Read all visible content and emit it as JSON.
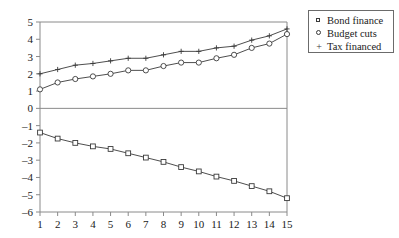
{
  "chart_data": {
    "type": "line",
    "title": "",
    "subtitle": "",
    "xlabel": "",
    "ylabel": "",
    "x": [
      1,
      2,
      3,
      4,
      5,
      6,
      7,
      8,
      9,
      10,
      11,
      12,
      13,
      14,
      15
    ],
    "xlim": [
      1,
      15
    ],
    "ylim": [
      -6,
      5
    ],
    "xticks": [
      "1",
      "2",
      "3",
      "4",
      "5",
      "6",
      "7",
      "8",
      "9",
      "10",
      "11",
      "12",
      "13",
      "14",
      "15"
    ],
    "yticks": [
      "5",
      "4",
      "3",
      "2",
      "1",
      "0",
      "-1",
      "-2",
      "-3",
      "-4",
      "-5",
      "-6"
    ],
    "grid": false,
    "zero_line": true,
    "legend_position": "right-top",
    "series": [
      {
        "name": "Bond finance",
        "marker": "square",
        "color": "#3a3a3a",
        "values": [
          -1.4,
          -1.75,
          -2.0,
          -2.2,
          -2.35,
          -2.6,
          -2.85,
          -3.1,
          -3.4,
          -3.65,
          -3.95,
          -4.2,
          -4.5,
          -4.8,
          -5.2
        ]
      },
      {
        "name": "Budget cuts",
        "marker": "diamond",
        "color": "#3a3a3a",
        "values": [
          1.1,
          1.5,
          1.7,
          1.85,
          2.0,
          2.2,
          2.2,
          2.45,
          2.65,
          2.65,
          2.9,
          3.1,
          3.5,
          3.75,
          4.3
        ]
      },
      {
        "name": "Tax financed",
        "marker": "plus",
        "color": "#3a3a3a",
        "values": [
          2.0,
          2.25,
          2.5,
          2.6,
          2.75,
          2.9,
          2.9,
          3.1,
          3.3,
          3.3,
          3.5,
          3.6,
          3.95,
          4.2,
          4.6
        ]
      }
    ]
  },
  "legend": {
    "items": [
      {
        "label": "Bond finance",
        "marker": "square"
      },
      {
        "label": "Budget cuts",
        "marker": "diamond"
      },
      {
        "label": "Tax financed",
        "marker": "plus"
      }
    ]
  }
}
